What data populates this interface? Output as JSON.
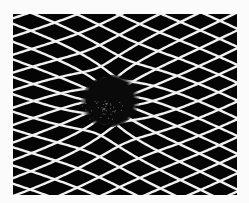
{
  "image": {
    "subject": "warped-grid-gravity-well",
    "description": "White diagonal mesh on black background, distorted around a dark central hole",
    "colors": {
      "background": "#fbfbfb",
      "field": "#050505",
      "mesh_lines": "#f2f2f2",
      "hole": "#0a0a0a"
    }
  }
}
